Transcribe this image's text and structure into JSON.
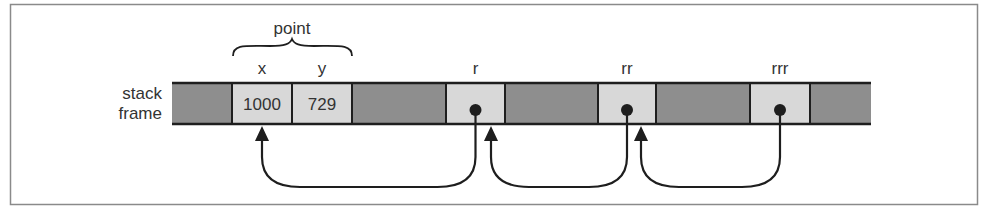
{
  "diagram": {
    "row_label": [
      "stack",
      "frame"
    ],
    "group_label": "point",
    "colors": {
      "frame_border": "#8a8a8a",
      "dark_cell": "#8e8e8e",
      "light_cell": "#d8d8d8",
      "line": "#1e1e1e",
      "text": "#333333"
    },
    "cells": [
      {
        "kind": "dark",
        "label": "",
        "value": ""
      },
      {
        "kind": "light",
        "label": "x",
        "value": "1000"
      },
      {
        "kind": "light",
        "label": "y",
        "value": "729"
      },
      {
        "kind": "dark",
        "label": "",
        "value": ""
      },
      {
        "kind": "light",
        "label": "r",
        "value": "",
        "pointer": true
      },
      {
        "kind": "dark",
        "label": "",
        "value": ""
      },
      {
        "kind": "light",
        "label": "rr",
        "value": "",
        "pointer": true
      },
      {
        "kind": "dark",
        "label": "",
        "value": ""
      },
      {
        "kind": "light",
        "label": "rrr",
        "value": "",
        "pointer": true
      },
      {
        "kind": "dark",
        "label": "",
        "value": ""
      }
    ],
    "pointers": [
      {
        "from": "r",
        "to": "point"
      },
      {
        "from": "rr",
        "to": "r"
      },
      {
        "from": "rrr",
        "to": "rr"
      }
    ]
  }
}
